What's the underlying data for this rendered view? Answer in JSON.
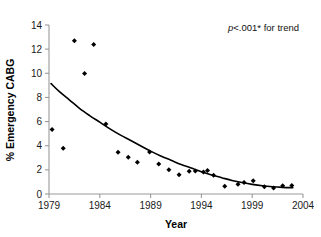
{
  "chart_data": {
    "type": "scatter",
    "title": "",
    "xlabel": "Year",
    "ylabel": "% Emergency CABG",
    "xlim": [
      1979,
      2004
    ],
    "ylim": [
      0,
      14
    ],
    "xticks": [
      1979,
      1984,
      1989,
      1994,
      1999,
      2004
    ],
    "xtick_labels": [
      "1979",
      "1984",
      "1989",
      "1994",
      "1999",
      "2004"
    ],
    "yticks": [
      0,
      2,
      4,
      6,
      8,
      10,
      12,
      14
    ],
    "ytick_labels": [
      "0",
      "2",
      "4",
      "6",
      "8",
      "10",
      "12",
      "14"
    ],
    "grid": false,
    "legend": null,
    "annotations": [
      {
        "text": "p<.001* for trend",
        "italic_prefix": "p",
        "rest": "<.001* for trend",
        "x": 1999.5,
        "y": 13.2
      }
    ],
    "series": [
      {
        "name": "Observed % Emergency CABG",
        "type": "scatter",
        "marker": "filled-diamond",
        "color": "#000000",
        "points": [
          {
            "x": 1979.3,
            "y": 5.35
          },
          {
            "x": 1980.4,
            "y": 3.8
          },
          {
            "x": 1981.5,
            "y": 12.7
          },
          {
            "x": 1982.5,
            "y": 9.98
          },
          {
            "x": 1983.4,
            "y": 12.38
          },
          {
            "x": 1984.6,
            "y": 5.8
          },
          {
            "x": 1985.8,
            "y": 3.45
          },
          {
            "x": 1986.8,
            "y": 3.05
          },
          {
            "x": 1987.7,
            "y": 2.62
          },
          {
            "x": 1988.9,
            "y": 3.48
          },
          {
            "x": 1989.8,
            "y": 2.48
          },
          {
            "x": 1990.8,
            "y": 2.0
          },
          {
            "x": 1991.8,
            "y": 1.6
          },
          {
            "x": 1992.8,
            "y": 1.88
          },
          {
            "x": 1993.4,
            "y": 1.9
          },
          {
            "x": 1994.2,
            "y": 1.82
          },
          {
            "x": 1994.6,
            "y": 1.95
          },
          {
            "x": 1995.2,
            "y": 1.55
          },
          {
            "x": 1996.3,
            "y": 0.65
          },
          {
            "x": 1997.6,
            "y": 0.8
          },
          {
            "x": 1998.2,
            "y": 0.95
          },
          {
            "x": 1999.1,
            "y": 1.1
          },
          {
            "x": 2000.2,
            "y": 0.6
          },
          {
            "x": 2001.1,
            "y": 0.5
          },
          {
            "x": 2002.0,
            "y": 0.68
          },
          {
            "x": 2002.9,
            "y": 0.7
          }
        ]
      },
      {
        "name": "Fitted trend",
        "type": "line",
        "color": "#000000",
        "points": [
          {
            "x": 1979.2,
            "y": 9.15
          },
          {
            "x": 1980.0,
            "y": 8.5
          },
          {
            "x": 1981.0,
            "y": 7.8
          },
          {
            "x": 1982.0,
            "y": 7.1
          },
          {
            "x": 1983.0,
            "y": 6.5
          },
          {
            "x": 1984.0,
            "y": 5.95
          },
          {
            "x": 1985.0,
            "y": 5.4
          },
          {
            "x": 1986.0,
            "y": 4.9
          },
          {
            "x": 1987.0,
            "y": 4.45
          },
          {
            "x": 1988.0,
            "y": 4.0
          },
          {
            "x": 1989.0,
            "y": 3.55
          },
          {
            "x": 1990.0,
            "y": 3.15
          },
          {
            "x": 1991.0,
            "y": 2.8
          },
          {
            "x": 1992.0,
            "y": 2.45
          },
          {
            "x": 1993.0,
            "y": 2.15
          },
          {
            "x": 1994.0,
            "y": 1.85
          },
          {
            "x": 1995.0,
            "y": 1.58
          },
          {
            "x": 1996.0,
            "y": 1.35
          },
          {
            "x": 1997.0,
            "y": 1.12
          },
          {
            "x": 1998.0,
            "y": 0.95
          },
          {
            "x": 1999.0,
            "y": 0.8
          },
          {
            "x": 2000.0,
            "y": 0.68
          },
          {
            "x": 2001.0,
            "y": 0.6
          },
          {
            "x": 2002.0,
            "y": 0.55
          },
          {
            "x": 2003.0,
            "y": 0.52
          }
        ]
      }
    ]
  }
}
